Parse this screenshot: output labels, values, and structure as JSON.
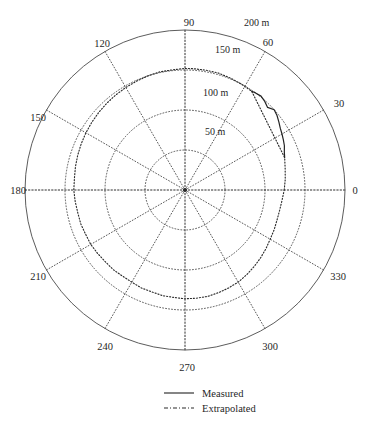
{
  "figure": {
    "caption": ""
  },
  "chart_data": {
    "type": "line",
    "projection": "polar",
    "title": "",
    "xlabel": "",
    "ylabel": "",
    "angle_unit": "degrees",
    "radius_unit": "m",
    "grid": true,
    "rlim": [
      0,
      200
    ],
    "theta_lim": [
      0,
      360
    ],
    "theta_direction": "counterclockwise",
    "theta_zero_location": "E",
    "angular_ticks": [
      0,
      30,
      60,
      90,
      120,
      150,
      180,
      210,
      240,
      270,
      300,
      330
    ],
    "angular_tick_labels": [
      "0",
      "30",
      "60",
      "90",
      "120",
      "150",
      "180",
      "210",
      "240",
      "270",
      "300",
      "330"
    ],
    "radial_ticks": [
      50,
      100,
      150,
      200
    ],
    "radial_tick_labels": [
      "50 m",
      "100 m",
      "150 m",
      "200 m"
    ],
    "legend_position": "below-plot",
    "series": [
      {
        "name": "Measured",
        "style": "solid",
        "theta_range": [
          18,
          56
        ],
        "theta": [
          18,
          21,
          24,
          27,
          30,
          33,
          36,
          39,
          42,
          45,
          48,
          51,
          54,
          56
        ],
        "r": [
          131,
          133,
          136,
          138,
          140,
          142,
          145,
          148,
          150,
          146,
          149,
          151,
          150,
          149
        ]
      },
      {
        "name": "Extrapolated",
        "style": "dash-dot",
        "theta": [
          0,
          6,
          12,
          18,
          56,
          62,
          68,
          74,
          80,
          86,
          90,
          96,
          102,
          108,
          114,
          120,
          126,
          132,
          138,
          144,
          150,
          156,
          162,
          168,
          174,
          180,
          186,
          192,
          198,
          204,
          210,
          216,
          222,
          228,
          234,
          240,
          246,
          252,
          258,
          264,
          270,
          276,
          282,
          288,
          294,
          300,
          306,
          312,
          318,
          324,
          330,
          336,
          342,
          348,
          354,
          360
        ],
        "r": [
          124,
          126,
          128,
          131,
          149,
          150,
          151,
          152,
          152,
          152,
          152,
          151,
          151,
          150,
          149,
          148,
          147,
          146,
          145,
          144,
          143,
          142,
          141,
          140,
          139,
          139,
          138,
          137,
          137,
          136,
          136,
          135,
          134,
          134,
          133,
          133,
          134,
          134,
          135,
          135,
          136,
          136,
          136,
          135,
          134,
          133,
          131,
          129,
          127,
          125,
          123,
          122,
          121,
          121,
          122,
          124
        ]
      }
    ]
  },
  "legend": {
    "items": [
      {
        "label": "Measured",
        "style": "solid"
      },
      {
        "label": "Extrapolated",
        "style": "dash-dot"
      }
    ]
  },
  "axis_labels": [
    {
      "angle": 0,
      "text": "0",
      "x": 355,
      "y": 194,
      "anchor": "middle"
    },
    {
      "angle": 30,
      "text": "30",
      "x": 339,
      "y": 107,
      "anchor": "middle"
    },
    {
      "angle": 60,
      "text": "60",
      "x": 268,
      "y": 46,
      "anchor": "middle"
    },
    {
      "angle": 90,
      "text": "90",
      "x": 189,
      "y": 26,
      "anchor": "middle"
    },
    {
      "angle": 120,
      "text": "120",
      "x": 102,
      "y": 47,
      "anchor": "middle"
    },
    {
      "angle": 150,
      "text": "150",
      "x": 38,
      "y": 121,
      "anchor": "middle"
    },
    {
      "angle": 180,
      "text": "180",
      "x": 18,
      "y": 194,
      "anchor": "middle"
    },
    {
      "angle": 210,
      "text": "210",
      "x": 38,
      "y": 280,
      "anchor": "middle"
    },
    {
      "angle": 240,
      "text": "240",
      "x": 105,
      "y": 350,
      "anchor": "middle"
    },
    {
      "angle": 270,
      "text": "270",
      "x": 187,
      "y": 371,
      "anchor": "middle"
    },
    {
      "angle": 300,
      "text": "300",
      "x": 270,
      "y": 350,
      "anchor": "middle"
    },
    {
      "angle": 330,
      "text": "330",
      "x": 338,
      "y": 280,
      "anchor": "middle"
    }
  ],
  "radial_labels": [
    {
      "text": "50 m",
      "x": 205,
      "y": 135
    },
    {
      "text": "100 m",
      "x": 203,
      "y": 96
    },
    {
      "text": "150 m",
      "x": 215,
      "y": 53
    },
    {
      "text": "200 m",
      "x": 244,
      "y": 26
    }
  ]
}
